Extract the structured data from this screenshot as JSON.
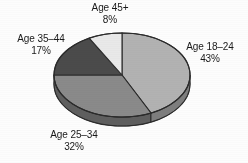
{
  "chart_data": {
    "type": "pie",
    "title": "",
    "subtitle": "",
    "xlabel": "",
    "ylabel": "",
    "legend_position": "outside-labels",
    "grid": false,
    "three_d": true,
    "categories": [
      "Age 18–24",
      "Age 25–34",
      "Age 35–44",
      "Age 45+"
    ],
    "values": [
      43,
      32,
      17,
      8
    ],
    "value_unit": "%",
    "colors": [
      "#b2b2b2",
      "#8a8a8a",
      "#4b4b4b",
      "#e9e9e9"
    ],
    "slices": [
      {
        "label": "Age 18–24",
        "value": 43,
        "value_text": "43%",
        "color": "#b2b2b2",
        "side_color": "#7e7e7e"
      },
      {
        "label": "Age 25–34",
        "value": 32,
        "value_text": "32%",
        "color": "#8a8a8a",
        "side_color": "#5f5f5f"
      },
      {
        "label": "Age 35–44",
        "value": 17,
        "value_text": "17%",
        "color": "#4b4b4b",
        "side_color": "#343434"
      },
      {
        "label": "Age 45+",
        "value": 8,
        "value_text": "8%",
        "color": "#e9e9e9",
        "side_color": "#a5a5a5"
      }
    ],
    "background_color": "#fdfdfd",
    "outline_color": "#2b2b2b",
    "total": 100
  },
  "labels": {
    "age_45": {
      "name": "Age 45+",
      "pct": "8%"
    },
    "age_35_44": {
      "name": "Age 35–44",
      "pct": "17%"
    },
    "age_18_24": {
      "name": "Age 18–24",
      "pct": "43%"
    },
    "age_25_34": {
      "name": "Age 25–34",
      "pct": "32%"
    }
  }
}
